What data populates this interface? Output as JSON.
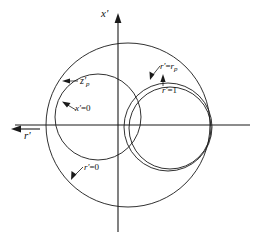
{
  "figure": {
    "axes": {
      "vertical_label": "x'",
      "vertical_label_base": "x",
      "vertical_prime": "′",
      "horizontal_label": "r'",
      "horizontal_label_base": "r",
      "horizontal_prime": "′",
      "vertical_arrow_direction": "up",
      "horizontal_arrow_direction": "left",
      "origin_px": [
        118,
        125
      ]
    },
    "annotations": [
      {
        "id": "zp",
        "text": "z'p",
        "base": "z",
        "prime": "′",
        "subscript": "p",
        "leader": "arrow-left",
        "target_curve": "x-prime-equals-zero"
      },
      {
        "id": "x0",
        "text": "x'=0",
        "base": "x",
        "prime": "′",
        "equals": "=0",
        "leader": "line-up-left",
        "target_curve": "x-prime-equals-zero"
      },
      {
        "id": "rp",
        "text": "r'=rp",
        "base": "r",
        "prime": "′",
        "equals": "=",
        "rhs_base": "r",
        "rhs_subscript": "p",
        "leader": "line-down-left",
        "target_curve": "r-prime-equals-rp"
      },
      {
        "id": "r1",
        "text": "r'=1",
        "base": "r",
        "prime": "′",
        "equals": "=1",
        "leader": "line-up",
        "target_curve": "r-prime-equals-one"
      },
      {
        "id": "r0",
        "text": "r'=0",
        "base": "r",
        "prime": "′",
        "equals": "=0",
        "leader": "line-down-left",
        "target_curve": "r-prime-equals-zero"
      }
    ],
    "colors": {
      "ink": "#1a1a1a",
      "background": "#ffffff"
    }
  },
  "chart_data": {
    "type": "diagram",
    "title": "",
    "xlabel": "r'",
    "ylabel": "x'",
    "grid": false,
    "legend": "none",
    "curves": [
      {
        "name": "r'=0",
        "label": "r'=0",
        "shape": "circle",
        "center_px": [
          128,
          125
        ],
        "radius_px": 82,
        "description": "largest circle, unit reflection-coefficient boundary"
      },
      {
        "name": "x'=0",
        "label": "x'=0",
        "shape": "circle",
        "center_px": [
          98,
          117
        ],
        "radius_px": 43,
        "description": "left circle tagged z'p"
      },
      {
        "name": "r'=rp",
        "label": "r'=rp",
        "shape": "circle",
        "center_px": [
          168,
          127
        ],
        "radius_px": 44,
        "description": "right outer of the close pair"
      },
      {
        "name": "r'=1",
        "label": "r'=1",
        "shape": "circle",
        "center_px": [
          170,
          128
        ],
        "radius_px": 41,
        "description": "right inner of the close pair"
      }
    ],
    "axis_ranges": {
      "x_px": [
        10,
        250
      ],
      "y_px": [
        16,
        230
      ]
    }
  }
}
